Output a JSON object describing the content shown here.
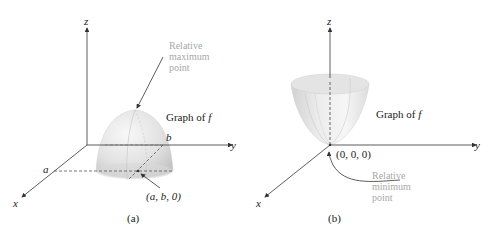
{
  "panels": [
    {
      "id": "a",
      "caption": "(a)",
      "axes": {
        "x": "x",
        "y": "y",
        "z": "z"
      },
      "surface": "downward paraboloid (dome)",
      "graph_label": "Graph of f",
      "graph_label_prefix": "Graph of ",
      "graph_label_var": "f",
      "point_label": "(a, b, 0)",
      "tick_a": "a",
      "tick_b": "b",
      "annotation": [
        "Relative",
        "maximum",
        "point"
      ]
    },
    {
      "id": "b",
      "caption": "(b)",
      "axes": {
        "x": "x",
        "y": "y",
        "z": "z"
      },
      "surface": "upward paraboloid (bowl)",
      "graph_label": "Graph of f",
      "graph_label_prefix": "Graph of ",
      "graph_label_var": "f",
      "point_label": "(0, 0, 0)",
      "annotation": [
        "Relative",
        "minimum",
        "point"
      ]
    }
  ],
  "colors": {
    "axis": "#333333",
    "annotation_text": "#a8a8a8",
    "surface_light": "#f4f4f4",
    "surface_dark": "#c9c9c9"
  }
}
